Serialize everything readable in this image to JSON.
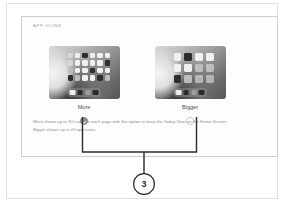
{
  "panel": {
    "title": "APP ICONS",
    "options": [
      {
        "id": "more",
        "label": "More",
        "selected": true,
        "radio_state": "selected",
        "screenshot_name": "ipad-home-screen-more-icons"
      },
      {
        "id": "bigger",
        "label": "Bigger",
        "selected": false,
        "radio_state": "unselected",
        "screenshot_name": "ipad-home-screen-bigger-icons"
      }
    ],
    "caption": {
      "line1": "More shows up to 30 icons on each page with the option to keep the Today View on the Home Screen.",
      "line2": "Bigger shows up to 20 app icons."
    }
  },
  "callout": {
    "number": "3"
  },
  "colors": {
    "page_border": "#e2e2e2",
    "panel_border": "#cfcfcf",
    "title_text": "#9b9b9b",
    "label_text": "#4d4d4d",
    "caption_text": "#8d8d8d",
    "radio_selected": "#8f8f8f",
    "radio_unselected_border": "#c6c6c6",
    "callout_stroke": "#2b2b2b"
  }
}
